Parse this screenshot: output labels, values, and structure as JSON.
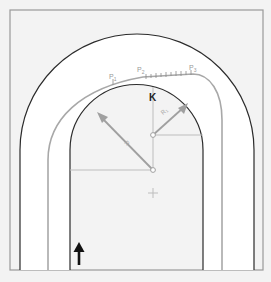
{
  "diagram": {
    "type": "track-curve-geometry",
    "colors": {
      "background": "#f3f3f3",
      "frame": "#9a9a9a",
      "track_fill": "#ffffff",
      "track_edge": "#2b2b2b",
      "racing_line": "#a8a8a8",
      "construction": "#bdbdbd",
      "arrow": "#111111"
    },
    "labels": {
      "p1": "P",
      "p1_sub": "1",
      "p2": "P",
      "p2_sub": "2",
      "p3": "P",
      "p3_sub": "3",
      "apex": "K",
      "radius_left": "R",
      "radius_right": "R",
      "radius_right_sub": "1"
    },
    "elements": {
      "direction_arrow": "up",
      "centers": [
        "center-large-radius",
        "center-small-radius",
        "center-cross"
      ]
    }
  }
}
